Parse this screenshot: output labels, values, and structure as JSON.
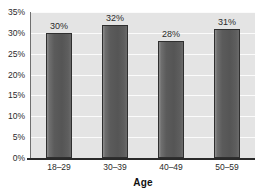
{
  "chart_data": {
    "type": "bar",
    "title": "",
    "categories": [
      "18–29",
      "30–39",
      "40–49",
      "50–59"
    ],
    "values": [
      30,
      32,
      28,
      31
    ],
    "data_labels": [
      "30%",
      "32%",
      "28%",
      "31%"
    ],
    "xlabel": "Age",
    "ylabel": "",
    "ylim": [
      0,
      35
    ],
    "ytick_values": [
      35,
      30,
      25,
      20,
      15,
      10,
      5,
      0
    ],
    "yticks": [
      "35%",
      "30%",
      "25%",
      "20%",
      "15%",
      "10%",
      "5%",
      "0%"
    ],
    "grid": true,
    "grid_orientation": "horizontal",
    "legend": null,
    "legend_position": "none",
    "colors": {
      "bar_fill": "#5b5b5b",
      "bar_fill_light": "#8d8d8d",
      "bar_border": "#2f2f2f",
      "plot_background": "#e4e4e4",
      "gridline": "#fbfbfb",
      "axis_line": "#2a2a2a",
      "page_background": "#ffffff",
      "text": "#2b2b2b"
    }
  }
}
